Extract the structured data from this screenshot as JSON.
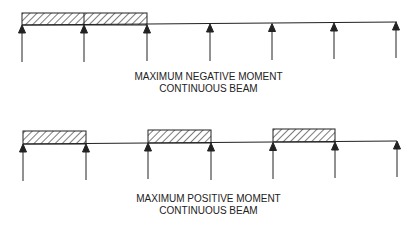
{
  "diagrams": [
    {
      "id": "negative",
      "caption_line1": "MAXIMUM NEGATIVE MOMENT",
      "caption_line2": "CONTINUOUS BEAM",
      "supports_x": [
        22,
        84,
        147,
        210,
        272,
        334,
        396
      ],
      "beam_y": 24,
      "loaded_spans": [
        [
          22,
          84
        ],
        [
          84,
          147
        ]
      ]
    },
    {
      "id": "positive",
      "caption_line1": "MAXIMUM POSITIVE MOMENT",
      "caption_line2": "CONTINUOUS BEAM",
      "supports_x": [
        23,
        86,
        148,
        211,
        273,
        335,
        397
      ],
      "beam_y": 143,
      "loaded_spans": [
        [
          23,
          86
        ],
        [
          148,
          211
        ],
        [
          273,
          335
        ]
      ]
    }
  ],
  "colors": {
    "line": "#222222",
    "background": "#ffffff"
  }
}
